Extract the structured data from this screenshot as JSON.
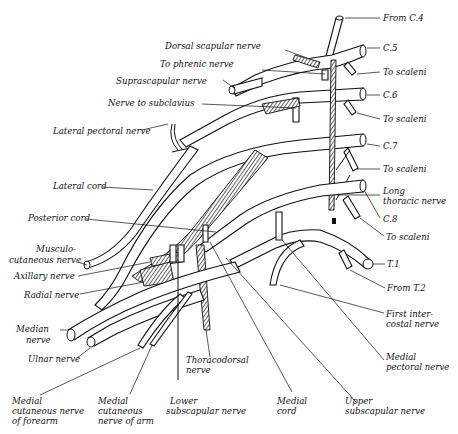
{
  "diagram": {
    "roots": [
      {
        "id": "c4",
        "label": "From C.4"
      },
      {
        "id": "c5",
        "label": "C.5"
      },
      {
        "id": "c6",
        "label": "C.6"
      },
      {
        "id": "c7",
        "label": "C.7"
      },
      {
        "id": "c8",
        "label": "C.8"
      },
      {
        "id": "t1",
        "label": "T.1"
      },
      {
        "id": "t2",
        "label": "From T.2"
      }
    ],
    "labels": {
      "from_c4": "From C.4",
      "c5": "C.5",
      "to_scaleni_1": "To scaleni",
      "c6": "C.6",
      "to_scaleni_2": "To scaleni",
      "c7": "C.7",
      "to_scaleni_3": "To scaleni",
      "long_thoracic_1": "Long",
      "long_thoracic_2": "thoracic nerve",
      "c8": "C.8",
      "to_scaleni_4": "To scaleni",
      "t1": "T.1",
      "from_t2": "From T.2",
      "first_intercostal_1": "First inter-",
      "first_intercostal_2": "costal nerve",
      "medial_pectoral_1": "Medial",
      "medial_pectoral_2": "pectoral nerve",
      "dorsal_scapular": "Dorsal scapular nerve",
      "to_phrenic": "To phrenic nerve",
      "suprascapular": "Suprascapular nerve",
      "nerve_to_subclavius": "Nerve to subclavius",
      "lateral_pectoral": "Lateral pectoral nerve",
      "lateral_cord": "Lateral cord",
      "posterior_cord": "Posterior cord",
      "musculocutaneous_1": "Musculo-",
      "musculocutaneous_2": "cutaneous nerve",
      "axillary": "Axillary nerve",
      "radial": "Radial nerve",
      "median_1": "Median",
      "median_2": "nerve",
      "ulnar": "Ulnar nerve",
      "med_cut_forearm_1": "Medial",
      "med_cut_forearm_2": "cutaneous nerve",
      "med_cut_forearm_3": "of forearm",
      "med_cut_arm_1": "Medial",
      "med_cut_arm_2": "cutaneous",
      "med_cut_arm_3": "nerve of arm",
      "thoracodorsal_1": "Thoracodorsal",
      "thoracodorsal_2": "nerve",
      "lower_subscapular_1": "Lower",
      "lower_subscapular_2": "subscapular nerve",
      "medial_cord_1": "Medial",
      "medial_cord_2": "cord",
      "upper_subscapular_1": "Upper",
      "upper_subscapular_2": "subscapular nerve"
    },
    "colors": {
      "ink": "#111111",
      "paper": "#fefefe"
    }
  }
}
